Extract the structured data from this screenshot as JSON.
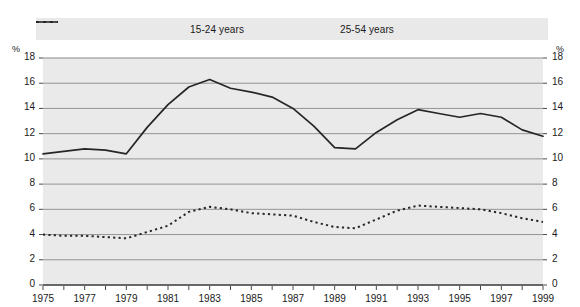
{
  "chart_data": {
    "type": "line",
    "title": "",
    "subtitle": "",
    "xlabel": "",
    "ylabel": "%",
    "ylabel_right": "%",
    "xlim": [
      1975,
      1999
    ],
    "ylim": [
      0,
      18
    ],
    "grid": true,
    "legend_position": "top-center",
    "y_ticks": [
      0,
      2,
      4,
      6,
      8,
      10,
      12,
      14,
      16,
      18
    ],
    "y_tick_labels": [
      "0",
      "2",
      "4",
      "6",
      "8",
      "10",
      "12",
      "14",
      "16",
      "18"
    ],
    "x": [
      1975,
      1976,
      1977,
      1978,
      1979,
      1980,
      1981,
      1982,
      1983,
      1984,
      1985,
      1986,
      1987,
      1988,
      1989,
      1990,
      1991,
      1992,
      1993,
      1994,
      1995,
      1996,
      1997,
      1998,
      1999
    ],
    "x_tick_labels": [
      "1975",
      "1977",
      "1979",
      "1981",
      "1983",
      "1985",
      "1987",
      "1989",
      "1991",
      "1993",
      "1995",
      "1997",
      "1999"
    ],
    "x_ticks_labeled": [
      1975,
      1977,
      1979,
      1981,
      1983,
      1985,
      1987,
      1989,
      1991,
      1993,
      1995,
      1997,
      1999
    ],
    "series": [
      {
        "name": "15-24 years",
        "style": "solid",
        "color": "#262626",
        "values": [
          10.4,
          10.6,
          10.8,
          10.7,
          10.4,
          12.5,
          14.3,
          15.7,
          16.3,
          15.6,
          15.3,
          14.9,
          14.0,
          12.6,
          10.9,
          10.8,
          12.1,
          13.1,
          13.9,
          13.6,
          13.3,
          13.6,
          13.3,
          12.3,
          11.8
        ]
      },
      {
        "name": "25-54 years",
        "style": "dotted",
        "color": "#262626",
        "values": [
          4.0,
          3.9,
          3.9,
          3.8,
          3.7,
          4.2,
          4.7,
          5.8,
          6.2,
          6.0,
          5.7,
          5.6,
          5.5,
          5.0,
          4.6,
          4.5,
          5.2,
          5.9,
          6.3,
          6.2,
          6.1,
          6.0,
          5.7,
          5.3,
          5.0
        ]
      }
    ]
  },
  "legend": {
    "items": [
      {
        "label": "15-24 years",
        "style": "solid"
      },
      {
        "label": "25-54 years",
        "style": "dotted"
      }
    ]
  },
  "axes": {
    "unit_left": "%",
    "unit_right": "%"
  },
  "colors": {
    "background": "#ffffff",
    "plot_background": "#eaeaea",
    "legend_band": "#e9e9e9",
    "gridline": "#8a8a8a",
    "line": "#262626",
    "text": "#1a1a1a"
  }
}
